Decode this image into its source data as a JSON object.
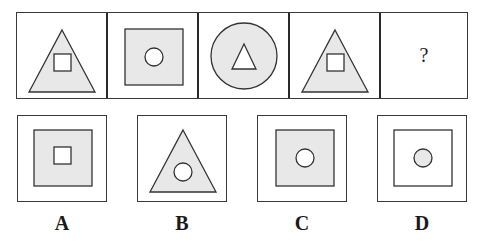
{
  "puzzle": {
    "sequence": [
      {
        "outer": "triangle",
        "inner": "square",
        "outer_fill": "#e8e8e8",
        "inner_fill": "#ffffff"
      },
      {
        "outer": "square",
        "inner": "circle",
        "outer_fill": "#e8e8e8",
        "inner_fill": "#ffffff"
      },
      {
        "outer": "circle",
        "inner": "triangle",
        "outer_fill": "#e8e8e8",
        "inner_fill": "#ffffff"
      },
      {
        "outer": "triangle",
        "inner": "square",
        "outer_fill": "#e8e8e8",
        "inner_fill": "#ffffff"
      },
      {
        "unknown": true,
        "symbol": "?"
      }
    ],
    "options": [
      {
        "label": "A",
        "outer": "square",
        "inner": "square",
        "outer_fill": "#e8e8e8",
        "inner_fill": "#ffffff"
      },
      {
        "label": "B",
        "outer": "triangle",
        "inner": "circle",
        "outer_fill": "#e8e8e8",
        "inner_fill": "#ffffff"
      },
      {
        "label": "C",
        "outer": "square",
        "inner": "circle",
        "outer_fill": "#e8e8e8",
        "inner_fill": "#ffffff"
      },
      {
        "label": "D",
        "outer": "square",
        "inner": "circle",
        "outer_fill": "#ffffff",
        "inner_fill": "#e8e8e8"
      }
    ]
  },
  "colors": {
    "stroke": "#333333",
    "shade": "#e8e8e8",
    "background": "#ffffff"
  }
}
